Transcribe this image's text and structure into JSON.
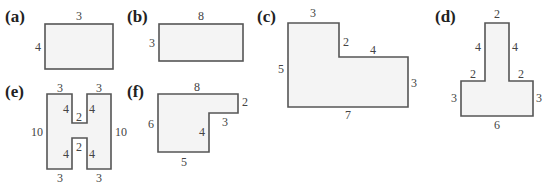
{
  "figures": [
    {
      "id": "a",
      "label": "(a)",
      "shape": "rectangle",
      "dimensions": {
        "top": "3",
        "left": "4"
      }
    },
    {
      "id": "b",
      "label": "(b)",
      "shape": "rectangle",
      "dimensions": {
        "top": "8",
        "left": "3"
      }
    },
    {
      "id": "c",
      "label": "(c)",
      "shape": "L-shape",
      "dimensions": {
        "top": "3",
        "inner_vertical": "2",
        "inner_horizontal": "4",
        "right": "3",
        "bottom": "7",
        "left": "5"
      }
    },
    {
      "id": "d",
      "label": "(d)",
      "shape": "T-shape",
      "dimensions": {
        "top": "2",
        "stem_left": "4",
        "stem_right": "4",
        "shoulder_left": "2",
        "shoulder_right": "2",
        "left": "3",
        "right": "3",
        "bottom": "6"
      }
    },
    {
      "id": "e",
      "label": "(e)",
      "shape": "H-shape",
      "dimensions": {
        "top_left": "3",
        "top_right": "3",
        "left": "10",
        "right": "10",
        "top_notch_left": "4",
        "top_notch_right": "4",
        "top_notch_bottom": "2",
        "bottom_notch_top": "2",
        "bottom_notch_left": "4",
        "bottom_notch_right": "4",
        "bottom_left": "3",
        "bottom_right": "3"
      }
    },
    {
      "id": "f",
      "label": "(f)",
      "shape": "L-shape",
      "dimensions": {
        "top": "8",
        "right": "2",
        "step_horizontal": "3",
        "step_vertical": "4",
        "bottom": "5",
        "left": "6"
      }
    }
  ]
}
